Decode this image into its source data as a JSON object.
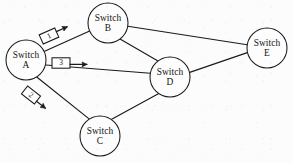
{
  "diagram": {
    "type": "network-graph",
    "width": 293,
    "height": 163,
    "background_color": "#fcfcfc",
    "stroke_color": "#1a1a1a",
    "nodes": [
      {
        "id": "A",
        "label_line1": "Switch",
        "label_line2": "A",
        "cx": 26,
        "cy": 60,
        "r": 20
      },
      {
        "id": "B",
        "label_line1": "Switch",
        "label_line2": "B",
        "cx": 108,
        "cy": 23,
        "r": 20
      },
      {
        "id": "C",
        "label_line1": "Switch",
        "label_line2": "C",
        "cx": 100,
        "cy": 136,
        "r": 20
      },
      {
        "id": "D",
        "label_line1": "Switch",
        "label_line2": "D",
        "cx": 170,
        "cy": 77,
        "r": 20
      },
      {
        "id": "E",
        "label_line1": "Switch",
        "label_line2": "E",
        "cx": 267,
        "cy": 48,
        "r": 20
      }
    ],
    "edges": [
      {
        "from": "A",
        "to": "B"
      },
      {
        "from": "A",
        "to": "C"
      },
      {
        "from": "A",
        "to": "D"
      },
      {
        "from": "B",
        "to": "D"
      },
      {
        "from": "B",
        "to": "E"
      },
      {
        "from": "C",
        "to": "D"
      },
      {
        "from": "D",
        "to": "E"
      }
    ],
    "packets": [
      {
        "id": "packet-1",
        "label": "1",
        "on_edge": "A-B",
        "x": 49,
        "y": 36,
        "rotation": -24,
        "direction": "toward-B"
      },
      {
        "id": "packet-3",
        "label": "3",
        "on_edge": "A-D",
        "x": 61,
        "y": 63,
        "rotation": 0,
        "direction": "toward-D"
      },
      {
        "id": "packet-2",
        "label": "2",
        "on_edge": "A-C",
        "x": 31,
        "y": 95,
        "rotation": 38,
        "direction": "toward-C"
      }
    ]
  }
}
